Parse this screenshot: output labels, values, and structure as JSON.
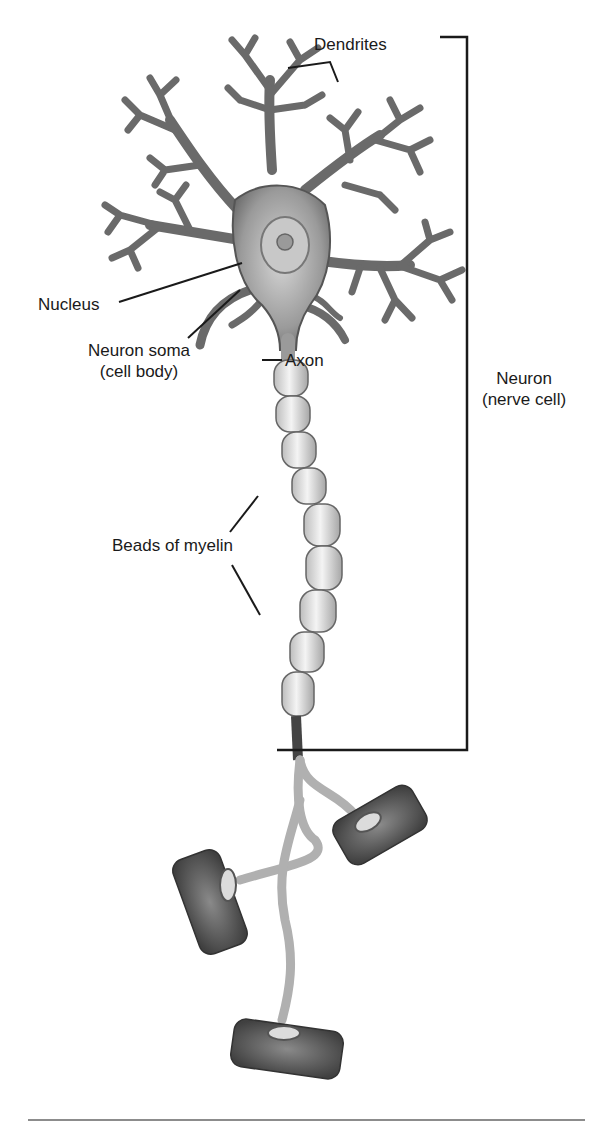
{
  "figure": {
    "labels": {
      "dendrites": "Dendrites",
      "nucleus": "Nucleus",
      "soma_line1": "Neuron soma",
      "soma_line2": "(cell body)",
      "axon": "Axon",
      "neuron_line1": "Neuron",
      "neuron_line2": "(nerve cell)",
      "myelin": "Beads of myelin"
    },
    "colors": {
      "line": "#1a1a1a",
      "cell_light": "#e6e6e6",
      "cell_mid": "#a8a8a8",
      "cell_dark": "#4a4a4a",
      "terminal": "#6e6e6e",
      "rule": "#8c8c8c"
    }
  }
}
